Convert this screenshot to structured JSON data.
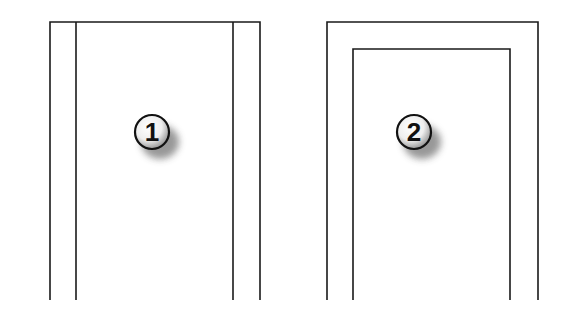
{
  "diagram": {
    "figures": [
      {
        "id": "figure-1",
        "label": "1",
        "description": "Frame with two vertical inner lines (side jambs only)"
      },
      {
        "id": "figure-2",
        "label": "2",
        "description": "Frame with nested inner frame (jambs plus head)"
      }
    ],
    "colors": {
      "line": "#1a1a1a",
      "background": "#ffffff",
      "badge_fill": "#f4f4f4"
    }
  }
}
